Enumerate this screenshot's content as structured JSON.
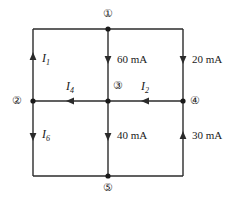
{
  "figure": {
    "background_color": "#ffffff",
    "wire_color": "#2b2b2b",
    "text_color": "#1a1a1a"
  },
  "nodes": [
    {
      "id": "1",
      "label": "①",
      "x": 108,
      "y": 29,
      "label_x": 103,
      "label_y": 8
    },
    {
      "id": "2",
      "label": "②",
      "x": 33,
      "y": 101,
      "label_x": 12,
      "label_y": 95
    },
    {
      "id": "3",
      "label": "③",
      "x": 108,
      "y": 101,
      "label_x": 113,
      "label_y": 80
    },
    {
      "id": "4",
      "label": "④",
      "x": 183,
      "y": 101,
      "label_x": 190,
      "label_y": 95
    },
    {
      "id": "5",
      "label": "⑤",
      "x": 108,
      "y": 176,
      "label_x": 103,
      "label_y": 182
    }
  ],
  "branches": [
    {
      "name": "left-upper-branch",
      "label": "I",
      "subscript": "1",
      "value": null,
      "unit": null,
      "orientation": "vertical",
      "direction": "up",
      "label_x": 42,
      "label_y": 52
    },
    {
      "name": "center-upper-branch",
      "label": "60 mA",
      "subscript": null,
      "value": 60,
      "unit": "mA",
      "orientation": "vertical",
      "direction": "down",
      "label_x": 117,
      "label_y": 54
    },
    {
      "name": "right-upper-branch",
      "label": "20 mA",
      "subscript": null,
      "value": 20,
      "unit": "mA",
      "orientation": "vertical",
      "direction": "down",
      "label_x": 192,
      "label_y": 54
    },
    {
      "name": "middle-left-branch",
      "label": "I",
      "subscript": "4",
      "value": null,
      "unit": null,
      "orientation": "horizontal",
      "direction": "left",
      "label_x": 66,
      "label_y": 80
    },
    {
      "name": "middle-right-branch",
      "label": "I",
      "subscript": "2",
      "value": null,
      "unit": null,
      "orientation": "horizontal",
      "direction": "left",
      "label_x": 141,
      "label_y": 80
    },
    {
      "name": "left-lower-branch",
      "label": "I",
      "subscript": "6",
      "value": null,
      "unit": null,
      "orientation": "vertical",
      "direction": "down",
      "label_x": 42,
      "label_y": 128
    },
    {
      "name": "center-lower-branch",
      "label": "40 mA",
      "subscript": null,
      "value": 40,
      "unit": "mA",
      "orientation": "vertical",
      "direction": "down",
      "label_x": 117,
      "label_y": 130
    },
    {
      "name": "right-lower-branch",
      "label": "30 mA",
      "subscript": null,
      "value": 30,
      "unit": "mA",
      "orientation": "vertical",
      "direction": "up",
      "label_x": 192,
      "label_y": 130
    }
  ]
}
